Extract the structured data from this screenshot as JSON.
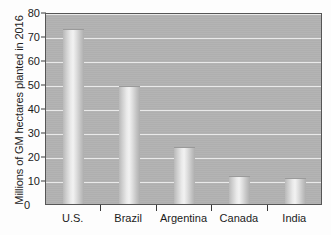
{
  "chart_data": {
    "type": "bar",
    "title": "",
    "xlabel": "",
    "ylabel": "Millions of GM hectares planted in 2016",
    "categories": [
      "U.S.",
      "Brazil",
      "Argentina",
      "Canada",
      "India"
    ],
    "values": [
      72.9,
      49.1,
      23.8,
      11.6,
      10.8
    ],
    "ylim": [
      0,
      80
    ],
    "ytick_labels": [
      "0",
      "10",
      "20",
      "30",
      "40",
      "50",
      "60",
      "70",
      "80"
    ],
    "ytick_values": [
      0,
      10,
      20,
      30,
      40,
      50,
      60,
      70,
      80
    ],
    "grid": "horizontal",
    "legend": "none",
    "colors": {
      "plot_background": "#b2b2b2",
      "gridline": "#f2f2f2",
      "bar_fill": "#dedede",
      "axis": "#565656",
      "text": "#1b1b1b"
    }
  }
}
